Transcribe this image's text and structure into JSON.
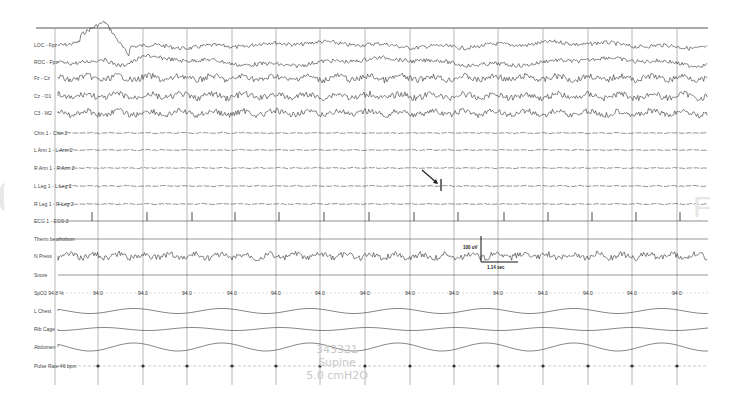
{
  "chart_data": {
    "type": "line",
    "xlabel": "",
    "ylabel": "",
    "grid": true,
    "channels": [
      {
        "name": "LOC - Fpz",
        "type": "EOG",
        "y": 45
      },
      {
        "name": "ROC - Fpz",
        "type": "EOG",
        "y": 62
      },
      {
        "name": "Fz - Cz",
        "type": "EEG",
        "y": 78
      },
      {
        "name": "Cz - O1",
        "type": "EEG",
        "y": 96
      },
      {
        "name": "C3 - M2",
        "type": "EEG",
        "y": 113
      },
      {
        "name": "Chin 1 - Chin 2",
        "type": "EMG",
        "y": 133
      },
      {
        "name": "L Arm 1 - L Arm 2",
        "type": "EMG",
        "y": 150
      },
      {
        "name": "R Arm 1 - R Arm 2",
        "type": "EMG",
        "y": 168
      },
      {
        "name": "L Leg 1 - L Leg 2",
        "type": "EMG",
        "y": 186
      },
      {
        "name": "R Leg 1 - R Leg 2",
        "type": "EMG",
        "y": 204
      },
      {
        "name": "ECG 1 - ECG 2",
        "type": "ECG",
        "y": 221
      },
      {
        "name": "Therm beathobum",
        "type": "Airflow",
        "y": 239
      },
      {
        "name": "N Press",
        "type": "Airflow",
        "y": 256
      },
      {
        "name": "Snore",
        "type": "Snore",
        "y": 275
      },
      {
        "name": "SpO2 94.8 %",
        "type": "Oximetry",
        "y": 293
      },
      {
        "name": "L Chest",
        "type": "Effort",
        "y": 311
      },
      {
        "name": "Rib Cage",
        "type": "Effort",
        "y": 329
      },
      {
        "name": "Abdomen",
        "type": "Effort",
        "y": 347
      },
      {
        "name": "Pulse Rate 46 bpm",
        "type": "Pulse",
        "y": 366
      }
    ],
    "spo2_values": [
      "94.0",
      "94.0",
      "94.0",
      "94.0",
      "94.0",
      "94.0",
      "94.0",
      "94.0",
      "94.0",
      "94.0",
      "94.0",
      "94.0",
      "94.0",
      "94.0"
    ],
    "pulse_markers": [
      "46",
      "46",
      "46",
      "46",
      "46",
      "46",
      "46",
      "46",
      "46",
      "46",
      "46",
      "46",
      "46",
      "46"
    ],
    "ecg_beat_x": [
      92,
      147,
      192,
      235,
      279,
      324,
      369,
      414,
      458,
      504,
      548,
      592,
      636,
      680
    ],
    "leg_movement_x": [
      441
    ],
    "annotations": [
      {
        "type": "arrow",
        "target": "L Leg 1 - L Leg 2",
        "x": 441,
        "label": "leg movement"
      },
      {
        "type": "calibration",
        "amplitude": "100 uV",
        "time": "1.14 sec",
        "x": 481,
        "y": 236
      }
    ],
    "gridlines_x": [
      55,
      98,
      143,
      187,
      232,
      276,
      320,
      365,
      410,
      454,
      498,
      543,
      588,
      632,
      677
    ],
    "watermark": [
      "343321",
      "Supine",
      "5.0 cmH2O"
    ]
  },
  "labels": {
    "loc": "LOC - Fpz",
    "roc": "ROC - Fpz",
    "fz": "Fz - Cz",
    "cz": "Cz - O1",
    "c3": "C3 - M2",
    "chin": "Chin 1 - Chin 2",
    "larm": "L Arm 1 - L Arm 2",
    "rarm": "R Arm 1 - R Arm 2",
    "lleg": "L Leg 1 - L Leg 2",
    "rleg": "R Leg 1 - R Leg 2",
    "ecg": "ECG 1 - ECG 2",
    "therm": "Therm beathobum",
    "npress": "N Press",
    "snore": "Snore",
    "spo2": "SpO2 94.8 %",
    "lchest": "L Chest",
    "ribcage": "Rib Cage",
    "abdomen": "Abdomen",
    "pulse": "Pulse Rate  46 bpm"
  },
  "calibration": {
    "amplitude": "100 uV",
    "time": "1.14 sec"
  },
  "watermark": {
    "line1": "343321",
    "line2": "Supine",
    "line3": "5.0 cmH2O"
  }
}
